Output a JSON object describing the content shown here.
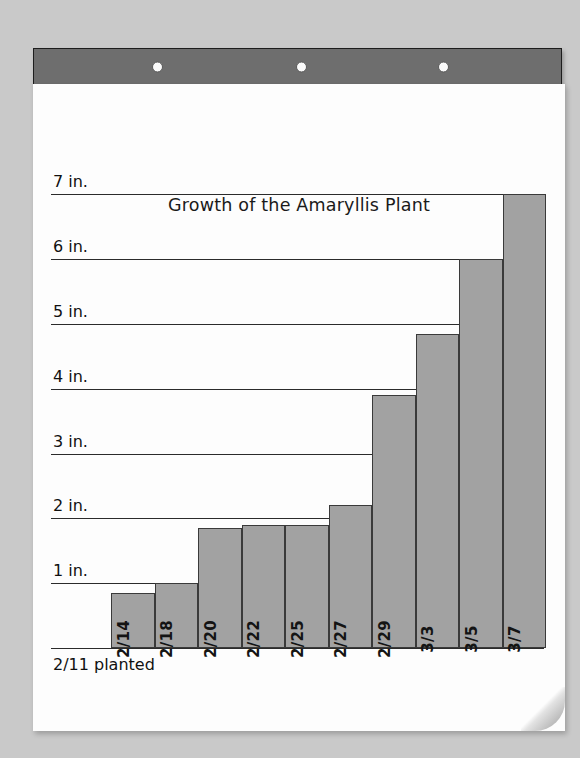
{
  "scene": {
    "background_color": "#c9c9c9",
    "paper_color": "#fdfdfd",
    "clipboard_bar_color": "#6e6e6e",
    "bar_fill_color": "#a2a2a2",
    "bar_stroke_color": "#3a3a3a",
    "hole_count": 3
  },
  "chart_data": {
    "type": "bar",
    "title": "Growth of the Amaryllis Plant",
    "xlabel": "",
    "ylabel": "",
    "ylim": [
      0,
      7.5
    ],
    "grid": true,
    "legend": "none",
    "y_unit": "in.",
    "y_tick_labels": [
      "1 in.",
      "2 in.",
      "3 in.",
      "4 in.",
      "5 in.",
      "6 in.",
      "7 in."
    ],
    "y_tick_values": [
      1,
      2,
      3,
      4,
      5,
      6,
      7
    ],
    "categories": [
      "2/14",
      "2/18",
      "2/20",
      "2/22",
      "2/25",
      "2/27",
      "2/29",
      "3/3",
      "3/5",
      "3/7"
    ],
    "values": [
      0.85,
      1.0,
      1.85,
      1.9,
      1.9,
      2.2,
      3.9,
      4.85,
      6.0,
      7.0
    ],
    "annotation": "2/11 planted"
  }
}
